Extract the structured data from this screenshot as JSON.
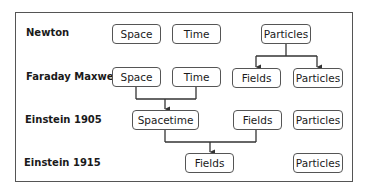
{
  "diagram": {
    "rows": [
      {
        "label": "Newton"
      },
      {
        "label": "Faraday Maxwell"
      },
      {
        "label": "Einstein 1905"
      },
      {
        "label": "Einstein 1915"
      }
    ],
    "nodes": {
      "newton_space": "Space",
      "newton_time": "Time",
      "newton_particles": "Particles",
      "fm_space": "Space",
      "fm_time": "Time",
      "fm_fields": "Fields",
      "fm_particles": "Particles",
      "e1905_spacetime": "Spacetime",
      "e1905_fields": "Fields",
      "e1905_particles": "Particles",
      "e1915_fields": "Fields",
      "e1915_particles": "Particles"
    },
    "edges": [
      {
        "from": "newton_particles",
        "to": [
          "fm_fields",
          "fm_particles"
        ],
        "type": "split"
      },
      {
        "from": [
          "fm_space",
          "fm_time"
        ],
        "to": "e1905_spacetime",
        "type": "merge"
      },
      {
        "from": [
          "e1905_spacetime",
          "e1905_fields"
        ],
        "to": "e1915_fields",
        "type": "merge"
      }
    ],
    "colors": {
      "line": "#333333",
      "box_border": "#555555",
      "frame": "#555555"
    }
  }
}
